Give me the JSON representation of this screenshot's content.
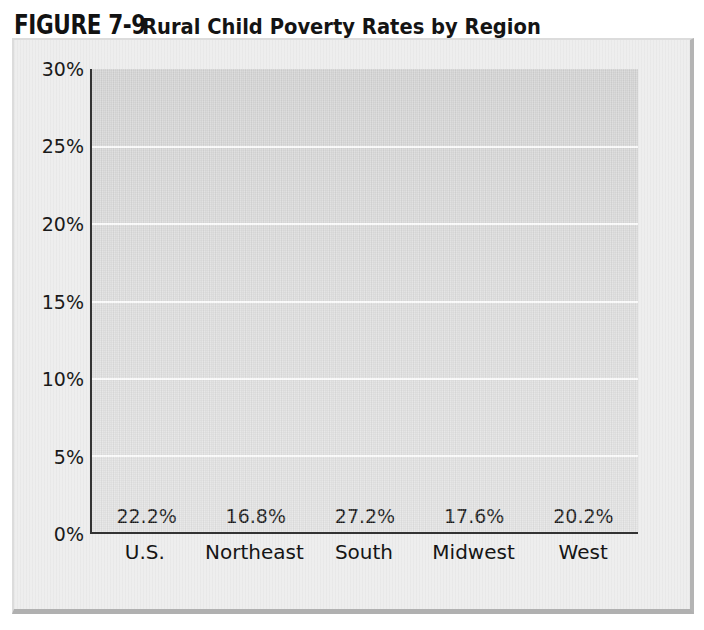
{
  "figure": {
    "label": "FIGURE 7-9",
    "caption": "Rural Child Poverty Rates by Region"
  },
  "colors": {
    "plot_background": "#dcdcdc",
    "frame_background": "#eeeeee",
    "gridline": "#fbfbfb",
    "axis_line": "#333333",
    "text": "#151515"
  },
  "chart_data": {
    "type": "bar",
    "title": "FIGURE 7-9 Rural Child Poverty Rates by Region",
    "subtitle": "",
    "xlabel": "",
    "ylabel": "",
    "categories": [
      "U.S.",
      "Northeast",
      "South",
      "Midwest",
      "West"
    ],
    "values": [
      22.2,
      16.8,
      27.2,
      17.6,
      20.2
    ],
    "data_labels": [
      "22.2%",
      "16.8%",
      "27.2%",
      "17.6%",
      "20.2%"
    ],
    "bar_colors": [
      "#4a4a4a",
      "#2b2b2b",
      "#c2c2c2",
      "#8a8a8a",
      "#9a9a9a"
    ],
    "bar_edge_colors": [
      "#2e2e2e",
      "#141414",
      "#a8a8a8",
      "#6a6a6a",
      "#7a7a7a"
    ],
    "ylim": [
      0,
      30
    ],
    "ytick_values": [
      30,
      25,
      20,
      15,
      10,
      5,
      0
    ],
    "ytick_labels": [
      "30%",
      "25%",
      "20%",
      "15%",
      "10%",
      "5%",
      "0%"
    ],
    "grid": "horizontal",
    "legend": "none"
  }
}
